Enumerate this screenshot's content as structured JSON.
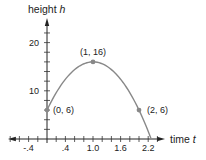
{
  "chart_data": {
    "type": "line",
    "title": "",
    "xlabel": "time",
    "xlabel_var": "t",
    "ylabel": "height",
    "ylabel_var": "h",
    "x_tick_labels": [
      "-.4",
      ".4",
      "1.0",
      "1.6",
      "2.2"
    ],
    "x_tick_values": [
      -0.4,
      0.4,
      1.0,
      1.6,
      2.2
    ],
    "y_tick_labels": [
      "10",
      "20"
    ],
    "y_tick_values": [
      10,
      20
    ],
    "xlim": [
      -0.85,
      2.6
    ],
    "ylim": [
      0,
      25
    ],
    "grid": false,
    "series": [
      {
        "name": "h(t) = -10t^2 + 20t + 6",
        "points": [
          {
            "x": 0,
            "y": 6,
            "label": "(0, 6)"
          },
          {
            "x": 1,
            "y": 16,
            "label": "(1, 16)"
          },
          {
            "x": 2,
            "y": 6,
            "label": "(2, 6)"
          }
        ],
        "x_intercept": 2.26,
        "color": "#888888"
      }
    ]
  }
}
